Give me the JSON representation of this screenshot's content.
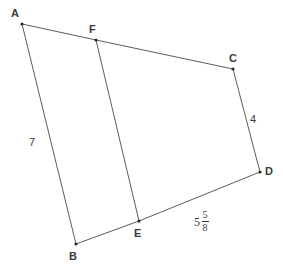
{
  "figure": {
    "background_color": "#ffffff",
    "line_color": "#4a4a4a",
    "label_color": "#3a3a3a",
    "width": 283,
    "height": 275,
    "vertices": [
      {
        "name": "A",
        "label": "A",
        "x": 22,
        "y": 24,
        "label_x": 11,
        "label_y": 8
      },
      {
        "name": "F",
        "label": "F",
        "x": 96,
        "y": 40,
        "label_x": 89,
        "label_y": 24
      },
      {
        "name": "C",
        "label": "C",
        "x": 233,
        "y": 69,
        "label_x": 229,
        "label_y": 53
      },
      {
        "name": "D",
        "label": "D",
        "x": 260,
        "y": 172,
        "label_x": 265,
        "label_y": 166
      },
      {
        "name": "E",
        "label": "E",
        "x": 139,
        "y": 221,
        "label_x": 134,
        "label_y": 228
      },
      {
        "name": "B",
        "label": "B",
        "x": 76,
        "y": 244,
        "label_x": 69,
        "label_y": 251
      }
    ],
    "edges": [
      {
        "name": "segment-AF",
        "from": "A",
        "to": "F"
      },
      {
        "name": "segment-FC",
        "from": "F",
        "to": "C"
      },
      {
        "name": "segment-CD",
        "from": "C",
        "to": "D"
      },
      {
        "name": "segment-DE",
        "from": "D",
        "to": "E"
      },
      {
        "name": "segment-EB",
        "from": "E",
        "to": "B"
      },
      {
        "name": "segment-BA",
        "from": "B",
        "to": "A"
      },
      {
        "name": "segment-FE",
        "from": "F",
        "to": "E"
      }
    ],
    "measures": [
      {
        "name": "length-AB",
        "segment": "AB",
        "kind": "plain",
        "text": "7",
        "x": 29,
        "y": 137
      },
      {
        "name": "length-CD",
        "segment": "CD",
        "kind": "plain",
        "text": "4",
        "x": 250,
        "y": 114
      },
      {
        "name": "length-ED",
        "segment": "ED",
        "kind": "mixed",
        "whole": "5",
        "numerator": "5",
        "denominator": "8",
        "text": "5 5/8",
        "x": 194,
        "y": 210
      }
    ]
  }
}
